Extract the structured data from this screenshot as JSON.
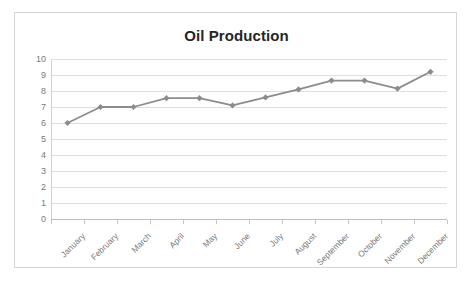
{
  "chart_data": {
    "type": "line",
    "title": "Oil Production",
    "xlabel": "",
    "ylabel": "",
    "categories": [
      "January",
      "February",
      "March",
      "April",
      "May",
      "June",
      "July",
      "August",
      "September",
      "October",
      "November",
      "December"
    ],
    "values": [
      6.0,
      7.0,
      7.0,
      7.55,
      7.55,
      7.1,
      7.6,
      8.1,
      8.65,
      8.65,
      8.15,
      9.2
    ],
    "series": [
      {
        "name": "Oil Production",
        "values": [
          6.0,
          7.0,
          7.0,
          7.55,
          7.55,
          7.1,
          7.6,
          8.1,
          8.65,
          8.65,
          8.15,
          9.2
        ]
      }
    ],
    "ylim": [
      0,
      10
    ],
    "y_ticks": [
      0,
      1,
      2,
      3,
      4,
      5,
      6,
      7,
      8,
      9,
      10
    ],
    "y_tick_labels": [
      "0",
      "1",
      "2",
      "3",
      "4",
      "5",
      "6",
      "7",
      "8",
      "9",
      "10"
    ],
    "grid": "horizontal",
    "legend": "none",
    "marker": "diamond",
    "colors": {
      "line": "#8c8c8c",
      "marker": "#8c8c8c",
      "gridline": "#dedede",
      "axis": "#bdbdbd",
      "title_text": "#262626",
      "tick_text": "#7a7a7a",
      "border": "#d5d5d5",
      "background": "#ffffff"
    }
  }
}
